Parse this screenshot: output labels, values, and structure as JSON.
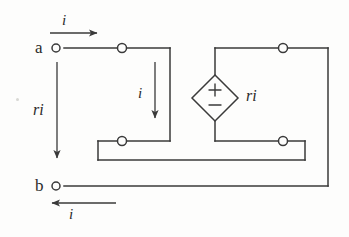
{
  "figure": {
    "kind": "circuit-diagram",
    "background_color": "#fdfdfc",
    "line_color": "#3a3a3a",
    "text_color": "#2b2b2b"
  },
  "terminals": [
    {
      "id": "a",
      "label": "a",
      "x": 56,
      "y": 48
    },
    {
      "id": "b",
      "label": "b",
      "x": 56,
      "y": 186
    }
  ],
  "nodes": [
    {
      "id": "top-left-node",
      "x": 122,
      "y": 48
    },
    {
      "id": "top-right-node",
      "x": 283,
      "y": 48
    },
    {
      "id": "mid-left-node",
      "x": 122,
      "y": 141
    },
    {
      "id": "mid-right-node",
      "x": 283,
      "y": 141
    }
  ],
  "source": {
    "id": "dependent-voltage-source",
    "type": "diamond",
    "label": "ri",
    "plus_sign": "+",
    "minus_sign": "−",
    "center_x": 215,
    "center_y": 98,
    "half_width": 23,
    "half_height": 23
  },
  "current_arrows": [
    {
      "id": "input-current",
      "label": "i",
      "direction": "right",
      "x1": 50,
      "y1": 33,
      "x2": 101,
      "y2": 33,
      "label_x": 62,
      "label_y": 13
    },
    {
      "id": "branch-current",
      "label": "i",
      "direction": "down",
      "x1": 155,
      "y1": 62,
      "x2": 155,
      "y2": 122,
      "label_x": 138,
      "label_y": 86
    },
    {
      "id": "voltage-drop-arrow",
      "label": "ri",
      "direction": "down",
      "x1": 57,
      "y1": 62,
      "x2": 57,
      "y2": 162,
      "label_x": 33,
      "label_y": 102
    },
    {
      "id": "return-current",
      "label": "i",
      "direction": "left",
      "x1": 116,
      "y1": 203,
      "x2": 48,
      "y2": 203,
      "label_x": 69,
      "label_y": 207
    }
  ],
  "wires": [
    {
      "id": "top-wire-a-to-corner",
      "points": "64,48 170,48"
    },
    {
      "id": "top-branch-down",
      "points": "170,48 170,141"
    },
    {
      "id": "mid-left-wire",
      "points": "170,141 98,141"
    },
    {
      "id": "mid-left-down",
      "points": "98,141 98,160"
    },
    {
      "id": "bottom-inner-wire",
      "points": "98,160 305,160"
    },
    {
      "id": "mid-right-up",
      "points": "305,160 305,141"
    },
    {
      "id": "mid-right-wire",
      "points": "305,141 215,141"
    },
    {
      "id": "source-bottom-lead",
      "points": "215,141 215,121"
    },
    {
      "id": "source-top-lead",
      "points": "215,75 215,48"
    },
    {
      "id": "top-right-wire",
      "points": "215,48 328,48"
    },
    {
      "id": "right-down-wire",
      "points": "328,48 328,186"
    },
    {
      "id": "bottom-wire-to-b",
      "points": "328,186 64,186"
    }
  ]
}
